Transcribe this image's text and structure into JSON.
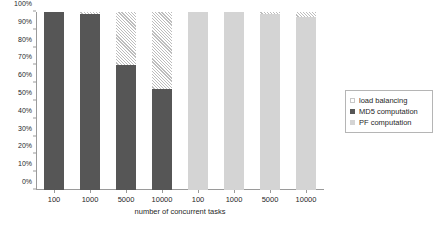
{
  "chart_data": {
    "type": "bar",
    "stacked": true,
    "percent_stacked": true,
    "title": "",
    "xlabel": "number of concurrent tasks",
    "ylabel": "",
    "ylim": [
      0,
      100
    ],
    "yticks": [
      "0%",
      "10%",
      "20%",
      "30%",
      "40%",
      "50%",
      "60%",
      "70%",
      "80%",
      "90%",
      "100%"
    ],
    "ytick_values": [
      0,
      10,
      20,
      30,
      40,
      50,
      60,
      70,
      80,
      90,
      100
    ],
    "grid": false,
    "legend_position": "right",
    "categories": [
      "100",
      "1000",
      "5000",
      "10000",
      "100",
      "1000",
      "5000",
      "10000"
    ],
    "group_labels": [
      "MD5 computation",
      "MD5 computation",
      "MD5 computation",
      "MD5 computation",
      "PF computation",
      "PF computation",
      "PF computation",
      "PF computation"
    ],
    "series": [
      {
        "name": "MD5 computation",
        "color": "#565656",
        "values": [
          100,
          99,
          70,
          56.5,
          0,
          0,
          0,
          0
        ]
      },
      {
        "name": "PF computation",
        "color": "#d4d4d4",
        "values": [
          0,
          0,
          0,
          0,
          100,
          100,
          99,
          97
        ]
      },
      {
        "name": "load balancing",
        "color": "#ffffff",
        "pattern": "diagonal-hatch",
        "values": [
          0,
          1,
          30,
          43.5,
          0,
          0,
          1,
          3
        ]
      }
    ],
    "legend": [
      {
        "label": "load balancing",
        "swatch": "hatch"
      },
      {
        "label": "MD5 computation",
        "swatch": "dark-gray"
      },
      {
        "label": "PF computation",
        "swatch": "light-gray"
      }
    ]
  },
  "colors": {
    "md5": "#565656",
    "pf": "#d4d4d4",
    "load_balancing": "#ffffff",
    "hatch_line": "#bdbdbd",
    "axis": "#9a9a9a",
    "text": "#1f1f1f",
    "background": "#ffffff"
  }
}
